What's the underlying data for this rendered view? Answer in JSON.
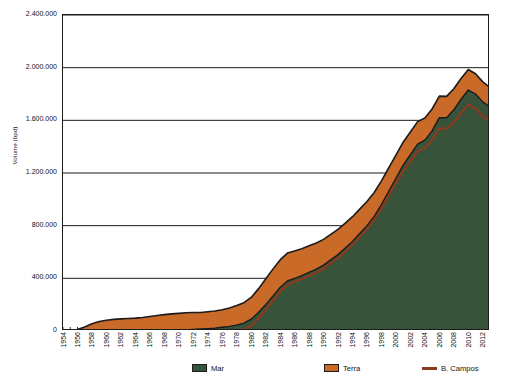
{
  "chart_data": {
    "type": "area",
    "title": "",
    "subtitle": "",
    "xlabel": "",
    "ylabel": "Volume (bpd)",
    "stacked": true,
    "grid": true,
    "legend_position": "bottom",
    "xlim": [
      1954,
      2013
    ],
    "ylim": [
      0,
      2400000
    ],
    "y_ticks": [
      0,
      400000,
      800000,
      1200000,
      1600000,
      2000000,
      2400000
    ],
    "y_tick_labels": [
      "0",
      "400.000",
      "800.000",
      "1.200.000",
      "1.600.000",
      "2.000.000",
      "2.400.000"
    ],
    "x_tick_labels": [
      "1954",
      "1956",
      "1958",
      "1960",
      "1962",
      "1964",
      "1966",
      "1968",
      "1970",
      "1972",
      "1974",
      "1976",
      "1978",
      "1980",
      "1982",
      "1984",
      "1986",
      "1988",
      "1990",
      "1992",
      "1994",
      "1996",
      "1998",
      "2000",
      "2002",
      "2004",
      "2006",
      "2008",
      "2010",
      "2012"
    ],
    "x": [
      1954,
      1955,
      1956,
      1957,
      1958,
      1959,
      1960,
      1961,
      1962,
      1963,
      1964,
      1965,
      1966,
      1967,
      1968,
      1969,
      1970,
      1971,
      1972,
      1973,
      1974,
      1975,
      1976,
      1977,
      1978,
      1979,
      1980,
      1981,
      1982,
      1983,
      1984,
      1985,
      1986,
      1987,
      1988,
      1989,
      1990,
      1991,
      1992,
      1993,
      1994,
      1995,
      1996,
      1997,
      1998,
      1999,
      2000,
      2001,
      2002,
      2003,
      2004,
      2005,
      2006,
      2007,
      2008,
      2009,
      2010,
      2011,
      2012,
      2013
    ],
    "series": [
      {
        "name": "Mar",
        "color": "#37543a",
        "type": "area",
        "values": [
          0,
          0,
          0,
          0,
          0,
          0,
          0,
          0,
          0,
          0,
          0,
          0,
          0,
          0,
          2000,
          4000,
          6000,
          9000,
          12000,
          15000,
          18000,
          22000,
          28000,
          35000,
          45000,
          60000,
          90000,
          140000,
          200000,
          265000,
          330000,
          380000,
          400000,
          420000,
          445000,
          470000,
          500000,
          540000,
          580000,
          630000,
          680000,
          740000,
          800000,
          870000,
          960000,
          1060000,
          1160000,
          1260000,
          1340000,
          1420000,
          1450000,
          1520000,
          1620000,
          1620000,
          1680000,
          1760000,
          1830000,
          1800000,
          1740000,
          1700000
        ]
      },
      {
        "name": "Terra",
        "color": "#c96a28",
        "type": "area",
        "values": [
          2000,
          5000,
          12000,
          30000,
          55000,
          72000,
          82000,
          88000,
          92000,
          95000,
          98000,
          103000,
          110000,
          118000,
          122000,
          126000,
          128000,
          130000,
          128000,
          126000,
          128000,
          130000,
          134000,
          140000,
          148000,
          155000,
          165000,
          180000,
          195000,
          205000,
          210000,
          212000,
          208000,
          205000,
          202000,
          198000,
          196000,
          194000,
          192000,
          190000,
          188000,
          186000,
          184000,
          182000,
          180000,
          178000,
          176000,
          174000,
          172000,
          170000,
          168000,
          166000,
          164000,
          162000,
          160000,
          158000,
          156000,
          154000,
          152000,
          150000
        ]
      },
      {
        "name": "B. Campos",
        "color": "#8c3a1e",
        "type": "line",
        "values": [
          0,
          0,
          0,
          0,
          0,
          0,
          0,
          0,
          0,
          0,
          0,
          0,
          0,
          0,
          0,
          0,
          0,
          0,
          0,
          0,
          0,
          0,
          0,
          0,
          3000,
          12000,
          40000,
          95000,
          160000,
          230000,
          300000,
          350000,
          375000,
          395000,
          420000,
          445000,
          475000,
          515000,
          555000,
          605000,
          655000,
          715000,
          775000,
          845000,
          930000,
          1030000,
          1125000,
          1215000,
          1290000,
          1365000,
          1390000,
          1450000,
          1540000,
          1535000,
          1585000,
          1655000,
          1720000,
          1690000,
          1630000,
          1590000
        ]
      }
    ],
    "legend": [
      {
        "label": "Mar",
        "color": "#37543a",
        "marker": "swatch"
      },
      {
        "label": "Terra",
        "color": "#c96a28",
        "marker": "swatch"
      },
      {
        "label": "B. Campos",
        "color": "#8c3a1e",
        "marker": "line"
      }
    ]
  },
  "axis": {
    "y_title": "Volume (bpd)"
  },
  "colors": {
    "mar": "#37543a",
    "terra": "#c96a28",
    "bcampos": "#8c3a1e",
    "outline": "#1b1b1b",
    "grid": "#1b1b1b",
    "background": "#ffffff"
  }
}
